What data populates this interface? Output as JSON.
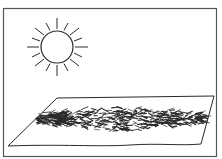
{
  "illustration": {
    "description": "Line drawing of a sun shining above a sheet with scattered plant material spread out to dry",
    "elements": {
      "sun": {
        "label": "sun",
        "rays": 16
      },
      "sheet": {
        "label": "sheet with spread material"
      },
      "frame": {
        "label": "border frame"
      }
    },
    "colors": {
      "ink": "#2a2a2a",
      "paper": "#ffffff",
      "frame": "#555555"
    }
  }
}
